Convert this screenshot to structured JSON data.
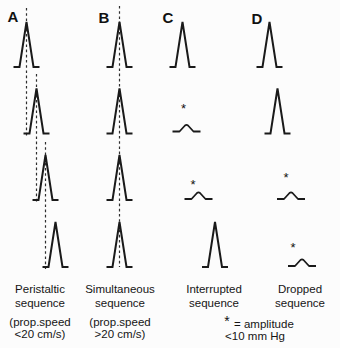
{
  "colors": {
    "background": "#fcfcfc",
    "stroke": "#1a1a1a",
    "guide_line": "#2e2e2e"
  },
  "low_amplitude_marker": "*",
  "panels": [
    {
      "letter": "A",
      "caption": [
        "Peristaltic",
        "sequence"
      ],
      "note": [
        "(prop.speed",
        "<20 cm/s)"
      ],
      "waves": [
        "normal",
        "normal",
        "normal",
        "normal"
      ],
      "wave_alignment": "progressively-delayed",
      "guides": "stepped-dashed-lines"
    },
    {
      "letter": "B",
      "caption": [
        "Simultaneous",
        "sequence"
      ],
      "note": [
        "(prop.speed",
        ">20 cm/s)"
      ],
      "waves": [
        "normal",
        "normal",
        "normal",
        "normal"
      ],
      "wave_alignment": "vertically-aligned",
      "guides": "single-dashed-line"
    },
    {
      "letter": "C",
      "caption": [
        "Interrupted",
        "sequence"
      ],
      "note": [],
      "waves": [
        "normal",
        "low-amplitude",
        "low-amplitude",
        "normal"
      ],
      "wave_alignment": "progressively-delayed",
      "guides": "none"
    },
    {
      "letter": "D",
      "caption": [
        "Dropped",
        "sequence"
      ],
      "note": [],
      "waves": [
        "normal",
        "normal",
        "low-amplitude",
        "low-amplitude"
      ],
      "wave_alignment": "progressively-delayed",
      "guides": "none"
    }
  ],
  "footnote": {
    "symbol": "*",
    "definition": "= amplitude",
    "value": "<10 mm Hg"
  }
}
